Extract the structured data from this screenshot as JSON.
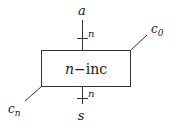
{
  "diagram": {
    "type": "block-diagram",
    "block": {
      "label_var": "n",
      "label_sep": "−",
      "label_name": "inc",
      "x": 41,
      "y": 50,
      "width": 89,
      "height": 36
    },
    "inputs": {
      "top": {
        "label": "a",
        "bus_width": "n"
      },
      "carry_in": {
        "label": "c",
        "subscript": "0"
      }
    },
    "outputs": {
      "bottom": {
        "label": "s",
        "bus_width": "n"
      },
      "carry_out": {
        "label": "c",
        "subscript": "n"
      }
    },
    "colors": {
      "stroke": "#333333",
      "text": "#222222",
      "background": "#ffffff"
    }
  }
}
